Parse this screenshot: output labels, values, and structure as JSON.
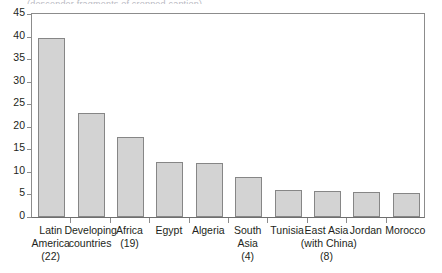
{
  "caption_sliver": "(descender fragments of cropped caption)",
  "chart_data": {
    "type": "bar",
    "title": "",
    "xlabel": "",
    "ylabel": "",
    "ylim": [
      0,
      45
    ],
    "ytick_step": 5,
    "grid": false,
    "legend": null,
    "yticks": [
      "45",
      "40",
      "35",
      "30",
      "25",
      "20",
      "15",
      "10",
      "5",
      "0"
    ],
    "categories": [
      "Latin America (22)",
      "Developing countries",
      "Africa (19)",
      "Egypt",
      "Algeria",
      "South Asia (4)",
      "Tunisia",
      "East Asia (with China) (8)",
      "Jordan",
      "Morocco"
    ],
    "category_lines": [
      [
        "Latin",
        "America",
        "(22)"
      ],
      [
        "Developing",
        "countries"
      ],
      [
        "Africa",
        "(19)"
      ],
      [
        "Egypt"
      ],
      [
        "Algeria"
      ],
      [
        "South",
        "Asia",
        "(4)"
      ],
      [
        "Tunisia"
      ],
      [
        "East Asia",
        "(with China)",
        "(8)"
      ],
      [
        "Jordan"
      ],
      [
        "Morocco"
      ]
    ],
    "values": [
      39.6,
      23.1,
      17.7,
      12.3,
      11.9,
      8.8,
      6.0,
      5.8,
      5.5,
      5.3
    ],
    "bar_fill": "#d3d3d3",
    "bar_stroke": "#868686",
    "axis_color": "#8c8c8c",
    "text_color": "#231f20"
  }
}
